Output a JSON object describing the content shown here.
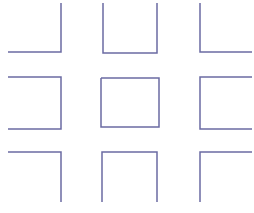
{
  "diagram": {
    "stroke_color": "#6b6ba3",
    "stroke_width": 1.5,
    "background": "#ffffff",
    "shapes": [
      {
        "name": "top-left-corner",
        "points": [
          [
            8,
            52
          ],
          [
            61,
            52
          ],
          [
            61,
            3
          ]
        ]
      },
      {
        "name": "top-middle-cup",
        "points": [
          [
            103,
            3
          ],
          [
            103,
            53
          ],
          [
            157,
            53
          ],
          [
            157,
            3
          ]
        ]
      },
      {
        "name": "top-right-corner",
        "points": [
          [
            200,
            3
          ],
          [
            200,
            52
          ],
          [
            252,
            52
          ]
        ]
      },
      {
        "name": "middle-left-bracket",
        "points": [
          [
            8,
            77
          ],
          [
            61,
            77
          ],
          [
            61,
            129
          ],
          [
            8,
            129
          ]
        ]
      },
      {
        "name": "center-square",
        "points": [
          [
            101,
            78
          ],
          [
            159,
            78
          ],
          [
            159,
            127
          ],
          [
            101,
            127
          ],
          [
            101,
            78
          ]
        ]
      },
      {
        "name": "middle-right-bracket",
        "points": [
          [
            252,
            77
          ],
          [
            200,
            77
          ],
          [
            200,
            129
          ],
          [
            252,
            129
          ]
        ]
      },
      {
        "name": "bottom-left-corner",
        "points": [
          [
            8,
            152
          ],
          [
            61,
            152
          ],
          [
            61,
            202
          ]
        ]
      },
      {
        "name": "bottom-middle-cap",
        "points": [
          [
            102,
            202
          ],
          [
            102,
            152
          ],
          [
            157,
            152
          ],
          [
            157,
            202
          ]
        ]
      },
      {
        "name": "bottom-right-corner",
        "points": [
          [
            200,
            202
          ],
          [
            200,
            152
          ],
          [
            252,
            152
          ]
        ]
      }
    ]
  }
}
